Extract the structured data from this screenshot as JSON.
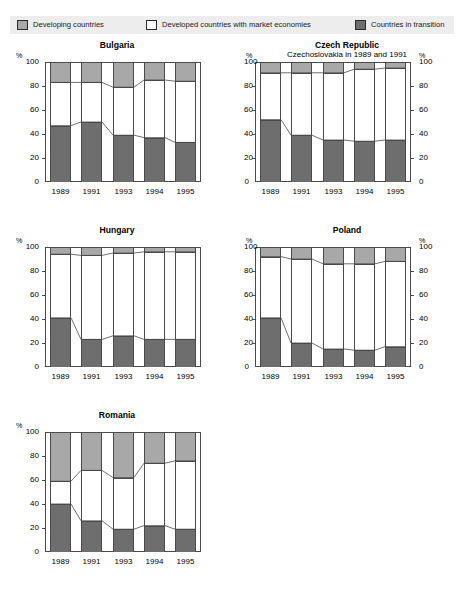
{
  "legend": {
    "items": [
      {
        "label": "Developing countries",
        "swatch": "developing-swatch",
        "color": "#a8a8a8"
      },
      {
        "label": "Developed countries with market economies",
        "swatch": "market-swatch",
        "color": "#ffffff"
      },
      {
        "label": "Countries in transition",
        "swatch": "transition-swatch",
        "color": "#6e6e6e"
      }
    ],
    "background": "#ededed"
  },
  "axis": {
    "unit": "%",
    "ticks": [
      "100",
      "80",
      "60",
      "40",
      "20",
      "0"
    ],
    "years": [
      "1989",
      "1991",
      "1993",
      "1994",
      "1995"
    ]
  },
  "panels": [
    {
      "title": "Bulgaria",
      "subtitle": ""
    },
    {
      "title": "Czech Republic",
      "subtitle": "Czechoslovakia in 1989 and 1991"
    },
    {
      "title": "Hungary",
      "subtitle": ""
    },
    {
      "title": "Poland",
      "subtitle": ""
    },
    {
      "title": "Romania",
      "subtitle": ""
    }
  ],
  "chart_data": [
    {
      "type": "bar",
      "stacked": true,
      "title": "Bulgaria",
      "xlabel": "",
      "ylabel": "%",
      "ylim": [
        0,
        100
      ],
      "yticks": [
        0,
        20,
        40,
        60,
        80,
        100
      ],
      "grid": false,
      "legend_position": "top",
      "categories": [
        "1989",
        "1991",
        "1993",
        "1994",
        "1995"
      ],
      "series": [
        {
          "name": "Countries in transition",
          "color": "#6e6e6e",
          "values": [
            47,
            50,
            39,
            37,
            33
          ]
        },
        {
          "name": "Developed countries with market economies",
          "color": "#ffffff",
          "values": [
            36,
            33,
            40,
            48,
            51
          ]
        },
        {
          "name": "Developing countries",
          "color": "#a8a8a8",
          "values": [
            17,
            17,
            21,
            15,
            16
          ]
        }
      ],
      "cumulative_upper": [
        83,
        83,
        79,
        85,
        84
      ]
    },
    {
      "type": "bar",
      "stacked": true,
      "title": "Czech Republic",
      "subtitle": "Czechoslovakia in 1989 and 1991",
      "xlabel": "",
      "ylabel": "%",
      "ylim": [
        0,
        100
      ],
      "yticks": [
        0,
        20,
        40,
        60,
        80,
        100
      ],
      "grid": false,
      "categories": [
        "1989",
        "1991",
        "1993",
        "1994",
        "1995"
      ],
      "series": [
        {
          "name": "Countries in transition",
          "color": "#6e6e6e",
          "values": [
            52,
            39,
            35,
            34,
            35
          ]
        },
        {
          "name": "Developed countries with market economies",
          "color": "#ffffff",
          "values": [
            39,
            52,
            56,
            60,
            60
          ]
        },
        {
          "name": "Developing countries",
          "color": "#a8a8a8",
          "values": [
            9,
            9,
            9,
            6,
            5
          ]
        }
      ],
      "cumulative_upper": [
        91,
        91,
        91,
        94,
        95
      ]
    },
    {
      "type": "bar",
      "stacked": true,
      "title": "Hungary",
      "xlabel": "",
      "ylabel": "%",
      "ylim": [
        0,
        100
      ],
      "yticks": [
        0,
        20,
        40,
        60,
        80,
        100
      ],
      "grid": false,
      "categories": [
        "1989",
        "1991",
        "1993",
        "1994",
        "1995"
      ],
      "series": [
        {
          "name": "Countries in transition",
          "color": "#6e6e6e",
          "values": [
            41,
            23,
            26,
            23,
            23
          ]
        },
        {
          "name": "Developed countries with market economies",
          "color": "#ffffff",
          "values": [
            53,
            70,
            69,
            73,
            73
          ]
        },
        {
          "name": "Developing countries",
          "color": "#a8a8a8",
          "values": [
            6,
            7,
            5,
            4,
            4
          ]
        }
      ],
      "cumulative_upper": [
        94,
        93,
        95,
        96,
        96
      ]
    },
    {
      "type": "bar",
      "stacked": true,
      "title": "Poland",
      "xlabel": "",
      "ylabel": "%",
      "ylim": [
        0,
        100
      ],
      "yticks": [
        0,
        20,
        40,
        60,
        80,
        100
      ],
      "grid": false,
      "categories": [
        "1989",
        "1991",
        "1993",
        "1994",
        "1995"
      ],
      "series": [
        {
          "name": "Countries in transition",
          "color": "#6e6e6e",
          "values": [
            41,
            20,
            15,
            14,
            17
          ]
        },
        {
          "name": "Developed countries with market economies",
          "color": "#ffffff",
          "values": [
            51,
            70,
            71,
            72,
            71
          ]
        },
        {
          "name": "Developing countries",
          "color": "#a8a8a8",
          "values": [
            8,
            10,
            14,
            14,
            12
          ]
        }
      ],
      "cumulative_upper": [
        92,
        90,
        86,
        86,
        88
      ]
    },
    {
      "type": "bar",
      "stacked": true,
      "title": "Romania",
      "xlabel": "",
      "ylabel": "%",
      "ylim": [
        0,
        100
      ],
      "yticks": [
        0,
        20,
        40,
        60,
        80,
        100
      ],
      "grid": false,
      "categories": [
        "1989",
        "1991",
        "1993",
        "1994",
        "1995"
      ],
      "series": [
        {
          "name": "Countries in transition",
          "color": "#6e6e6e",
          "values": [
            40,
            26,
            19,
            22,
            19
          ]
        },
        {
          "name": "Developed countries with market economies",
          "color": "#ffffff",
          "values": [
            19,
            42,
            43,
            52,
            57
          ]
        },
        {
          "name": "Developing countries",
          "color": "#a8a8a8",
          "values": [
            41,
            32,
            38,
            26,
            24
          ]
        }
      ],
      "cumulative_upper": [
        59,
        68,
        62,
        74,
        76
      ]
    }
  ]
}
